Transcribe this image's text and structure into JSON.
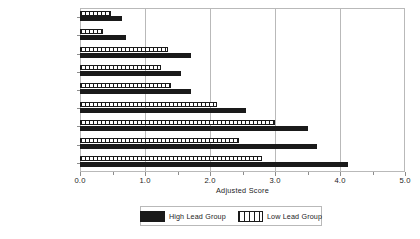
{
  "chart_data": {
    "type": "bar",
    "orientation": "horizontal",
    "title": "",
    "xlabel": "Adjusted Score",
    "ylabel": "",
    "xlim": [
      0.0,
      5.0
    ],
    "xticks": [
      0.0,
      1.0,
      2.0,
      3.0,
      4.0,
      5.0
    ],
    "xticklabels": [
      "0.0",
      "1.0",
      "2.0",
      "3.0",
      "4.0",
      "5.0"
    ],
    "minor_xticks": [
      0.5,
      1.5,
      2.5,
      3.5,
      4.5
    ],
    "grid": "vertical gridlines at major x ticks",
    "legend_position": "bottom-center, boxed, horizontal",
    "categories": [
      "thought problems",
      "somatic complaint",
      "withdrawn",
      "delinquent behavior",
      "social problems",
      "internalizing",
      "attention problems",
      "aggressive behavior",
      "externalizing"
    ],
    "series": [
      {
        "name": "High Lead Group",
        "style": "solid-black",
        "color": "#1a1a1a",
        "values": [
          0.65,
          0.7,
          1.7,
          1.55,
          1.7,
          2.55,
          3.5,
          3.65,
          4.12
        ]
      },
      {
        "name": "Low Lead Group",
        "style": "vertical-hatch",
        "color": "#1a1a1a",
        "values": [
          0.48,
          0.35,
          1.35,
          1.25,
          1.4,
          2.1,
          3.0,
          2.45,
          2.8
        ]
      }
    ]
  },
  "legend": {
    "entries": [
      {
        "label": "High Lead Group",
        "swatch": "solid-black-swatch"
      },
      {
        "label": "Low Lead Group",
        "swatch": "vertical-hatch-swatch"
      }
    ]
  },
  "axis": {
    "x_title": "Adjusted Score"
  }
}
